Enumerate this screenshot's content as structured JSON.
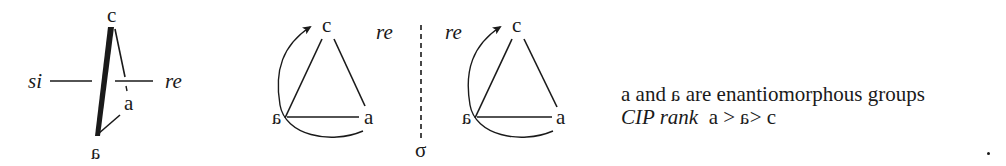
{
  "figure": {
    "projection": {
      "top_label": "c",
      "front_label": "a",
      "bottom_label": "a",
      "bottom_label_mirrored": true,
      "left_face": "si",
      "right_face": "re"
    },
    "triangle_left": {
      "top": "c",
      "left": "a",
      "left_mirrored": true,
      "right": "a",
      "face_label": "re",
      "rotation": "clockwise arrow from a toward c"
    },
    "mirror": {
      "symbol": "σ",
      "style": "dashed vertical line"
    },
    "triangle_right": {
      "top": "c",
      "left": "a",
      "left_mirrored": true,
      "right": "a",
      "face_label": "re",
      "rotation": "clockwise arrow from a toward c"
    },
    "caption": {
      "line1_a": "a and",
      "line1_b": "a",
      "line1_c": " are enantiomorphous groups",
      "line2_label": "CIP rank",
      "line2_a": "a >",
      "line2_b": "a",
      "line2_c": "> c"
    },
    "colors": {
      "ink": "#1a1a1a",
      "background": "#ffffff"
    }
  }
}
